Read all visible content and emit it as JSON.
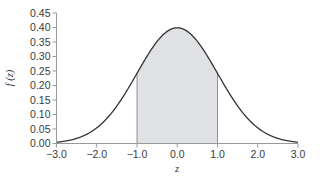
{
  "chart_data": {
    "type": "area",
    "title": "",
    "xlabel": "z",
    "ylabel": "f (z)",
    "xlim": [
      -3.0,
      3.0
    ],
    "ylim": [
      0.0,
      0.45
    ],
    "grid": false,
    "legend": null,
    "x_ticks": [
      "-3.0",
      "-2.0",
      "-1.0",
      "0.0",
      "1.0",
      "2.0",
      "3.0"
    ],
    "y_ticks": [
      "0.00",
      "0.05",
      "0.10",
      "0.15",
      "0.20",
      "0.25",
      "0.30",
      "0.35",
      "0.40",
      "0.45"
    ],
    "series": [
      {
        "name": "standard normal density f(z)",
        "x": [
          -3.0,
          -2.5,
          -2.0,
          -1.5,
          -1.0,
          -0.5,
          0.0,
          0.5,
          1.0,
          1.5,
          2.0,
          2.5,
          3.0
        ],
        "values": [
          0.004,
          0.018,
          0.054,
          0.13,
          0.242,
          0.352,
          0.399,
          0.352,
          0.242,
          0.13,
          0.054,
          0.018,
          0.004
        ]
      }
    ],
    "shaded_region": {
      "from": -1.0,
      "to": 1.0,
      "color": "#dfe1e4"
    },
    "colors": {
      "curve": "#333333",
      "axis": "#9a9a9a",
      "shade": "#dfe1e4"
    }
  }
}
